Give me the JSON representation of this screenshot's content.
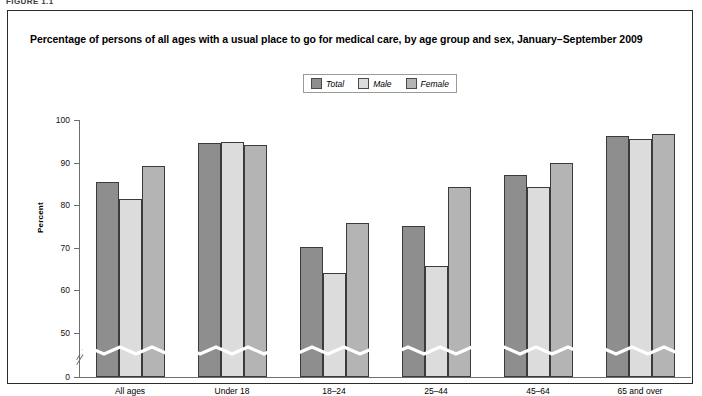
{
  "figure_label": "FIGURE 1.1",
  "title": "Percentage of persons of all ages with a usual place to go for medical care, by age group and sex, January–September 2009",
  "legend": {
    "items": [
      {
        "label": "Total",
        "color": "#8e8e8e"
      },
      {
        "label": "Male",
        "color": "#dcdcdc"
      },
      {
        "label": "Female",
        "color": "#b4b4b4"
      }
    ]
  },
  "axis": {
    "ylabel": "Percent",
    "yticks": [
      "0",
      "50",
      "60",
      "70",
      "80",
      "90",
      "100"
    ],
    "break_note": "axis break between 0 and 50"
  },
  "chart_data": {
    "type": "bar",
    "title": "Percentage of persons of all ages with a usual place to go for medical care, by age group and sex, January–September 2009",
    "xlabel": "",
    "ylabel": "Percent",
    "ylim": [
      50,
      100
    ],
    "axis_break": true,
    "grid": false,
    "legend_position": "top-center",
    "categories": [
      "All ages",
      "Under 18",
      "18–24",
      "25–44",
      "45–64",
      "65 and over"
    ],
    "series": [
      {
        "name": "Total",
        "color": "#8e8e8e",
        "values": [
          85.5,
          94.5,
          70.2,
          75.2,
          87.2,
          96.2
        ]
      },
      {
        "name": "Male",
        "color": "#dcdcdc",
        "values": [
          81.4,
          94.9,
          64.1,
          65.8,
          84.2,
          95.5
        ]
      },
      {
        "name": "Female",
        "color": "#b4b4b4",
        "values": [
          89.2,
          94.2,
          75.9,
          84.3,
          89.9,
          96.8
        ]
      }
    ]
  }
}
